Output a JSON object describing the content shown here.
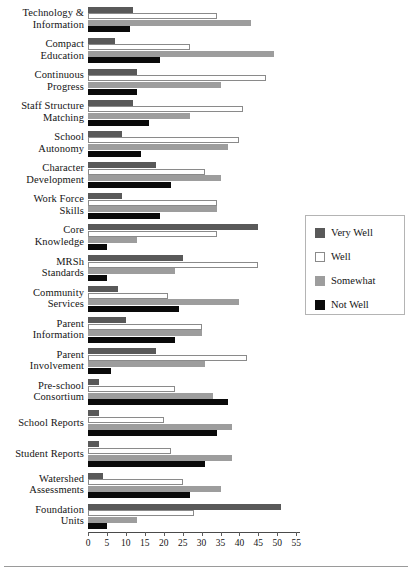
{
  "chart_data": {
    "type": "bar",
    "orientation": "horizontal",
    "title": "",
    "subtitle": "",
    "xlabel": "",
    "ylabel": "",
    "xlim": [
      0,
      56
    ],
    "xticks": [
      0,
      5,
      10,
      15,
      20,
      25,
      30,
      35,
      40,
      45,
      50,
      55
    ],
    "xtick_labels": [
      "0",
      "5",
      "10",
      "15",
      "20",
      "25",
      "30",
      "35",
      "40",
      "45",
      "50",
      "55"
    ],
    "grid": false,
    "legend_position": "right",
    "categories": [
      "Technology & Information",
      "Compact Education",
      "Continuous Progress",
      "Staff Structure Matching",
      "School Autonomy",
      "Character Development",
      "Work Force Skills",
      "Core Knowledge",
      "MRSh Standards",
      "Community Services",
      "Parent Information",
      "Parent Involvement",
      "Pre-school Consortium",
      "School Reports",
      "Student Reports",
      "Watershed Assessments",
      "Foundation Units"
    ],
    "category_lines": [
      [
        "Technology &",
        "Information"
      ],
      [
        "Compact",
        "Education"
      ],
      [
        "Continuous",
        "Progress"
      ],
      [
        "Staff Structure",
        "Matching"
      ],
      [
        "School",
        "Autonomy"
      ],
      [
        "Character",
        "Development"
      ],
      [
        "Work Force",
        "Skills"
      ],
      [
        "Core",
        "Knowledge"
      ],
      [
        "MRSh",
        "Standards"
      ],
      [
        "Community",
        "Services"
      ],
      [
        "Parent",
        "Information"
      ],
      [
        "Parent",
        "Involvement"
      ],
      [
        "Pre-school",
        "Consortium"
      ],
      [
        "School Reports"
      ],
      [
        "Student Reports"
      ],
      [
        "Watershed",
        "Assessments"
      ],
      [
        "Foundation",
        "Units"
      ]
    ],
    "series": [
      {
        "name": "Very Well",
        "color": "#595959",
        "values": [
          12,
          7,
          13,
          12,
          9,
          18,
          9,
          45,
          25,
          8,
          10,
          18,
          3,
          3,
          3,
          4,
          51
        ]
      },
      {
        "name": "Well",
        "color": "#ffffff",
        "values": [
          34,
          27,
          47,
          41,
          40,
          31,
          34,
          34,
          45,
          21,
          30,
          42,
          23,
          20,
          22,
          25,
          28
        ]
      },
      {
        "name": "Somewhat",
        "color": "#9d9d9d",
        "values": [
          43,
          49,
          35,
          27,
          37,
          35,
          34,
          13,
          23,
          40,
          30,
          31,
          33,
          38,
          38,
          35,
          13
        ]
      },
      {
        "name": "Not Well",
        "color": "#0a0a0a",
        "values": [
          11,
          19,
          13,
          16,
          14,
          22,
          19,
          5,
          5,
          24,
          23,
          6,
          37,
          34,
          31,
          27,
          5
        ]
      }
    ]
  },
  "legend": {
    "entries": [
      {
        "label": "Very Well"
      },
      {
        "label": "Well"
      },
      {
        "label": "Somewhat"
      },
      {
        "label": "Not Well"
      }
    ]
  }
}
